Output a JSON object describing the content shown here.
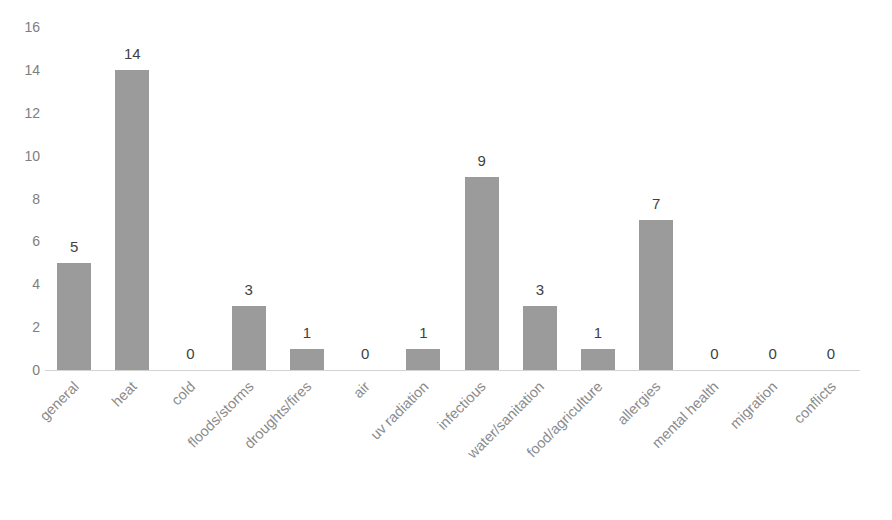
{
  "chart_data": {
    "type": "bar",
    "title": "",
    "xlabel": "",
    "ylabel": "",
    "ylim": [
      0,
      16
    ],
    "yticks": [
      16,
      14,
      12,
      10,
      8,
      6,
      4,
      2,
      0
    ],
    "grid": false,
    "legend": false,
    "bar_color": "#9b9b9b",
    "categories": [
      "general",
      "heat",
      "cold",
      "floods/storms",
      "droughts/fires",
      "air",
      "uv radiation",
      "infectious",
      "water/sanitation",
      "food/agriculture",
      "allergies",
      "mental health",
      "migration",
      "conflicts"
    ],
    "values": [
      5,
      14,
      0,
      3,
      1,
      0,
      1,
      9,
      3,
      1,
      7,
      0,
      0,
      0
    ],
    "data_labels": [
      "5",
      "14",
      "0",
      "3",
      "1",
      "0",
      "1",
      "9",
      "3",
      "1",
      "7",
      "0",
      "0",
      "0"
    ]
  },
  "title_remnant": "",
  "colors": {
    "bar": "#9b9b9b",
    "axis": "#d3d3d3",
    "tick_text": "#7e7e7e",
    "category_text": "#8a8a8a",
    "data_label_text": "#3f3f3f",
    "background": "#ffffff"
  }
}
